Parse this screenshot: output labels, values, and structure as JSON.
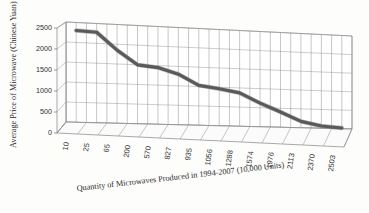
{
  "chart_data": {
    "type": "line",
    "title": "",
    "xlabel": "Quantity of Microwaves Produced in 1994-2007 (10,000 Units)",
    "ylabel": "Average Price of Microwave (Chinese Yuan)",
    "categories": [
      "10",
      "25",
      "65",
      "200",
      "570",
      "827",
      "935",
      "1056",
      "1288",
      "1574",
      "1976",
      "2113",
      "2370",
      "2503"
    ],
    "values": [
      2300,
      2280,
      1850,
      1500,
      1450,
      1300,
      1030,
      960,
      870,
      620,
      400,
      170,
      60,
      20
    ],
    "yticks": [
      0,
      500,
      1000,
      1500,
      2000,
      2500
    ],
    "ytick_labels": [
      "0",
      "500",
      "1000",
      "1500",
      "2000",
      "2500"
    ],
    "ylim": [
      0,
      2500
    ],
    "grid": true,
    "legend": "none",
    "series": [
      {
        "name": "Average Price of Microwave (Chinese Yuan)",
        "values": [
          2300,
          2280,
          1850,
          1500,
          1450,
          1300,
          1030,
          960,
          870,
          620,
          400,
          170,
          60,
          20
        ]
      }
    ],
    "style": {
      "line_color": "#5a5a5a",
      "grid_color": "#9a9a9a",
      "axis_color": "#6e6e6e",
      "background": "#ffffff",
      "projection": "3d"
    }
  }
}
